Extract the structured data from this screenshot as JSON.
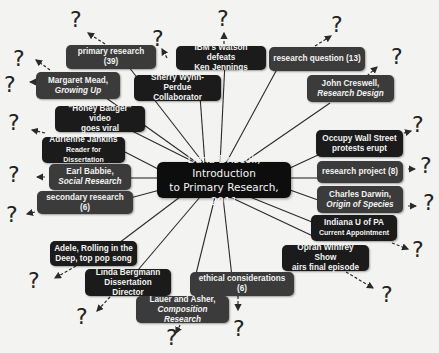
{
  "center": {
    "line1": "Dana Driscoll, Introduction",
    "line2": "to Primary Research, 2011"
  },
  "colors": {
    "background": "#f3f3f1",
    "center_node": "#0d0d0d",
    "dark_node": "#1b1b1b",
    "gray_node": "#3b3b3b",
    "text": "#f2f2f2",
    "link": "#2a2a2a"
  },
  "question_mark": "?",
  "nodes": [
    {
      "id": "primary-research",
      "line1": "primary research (39)",
      "line2": ""
    },
    {
      "id": "ibm-watson",
      "line1": "IBM's Watson defeats",
      "line2": "Ken Jennings"
    },
    {
      "id": "research-question",
      "line1": "research question (13)",
      "line2": ""
    },
    {
      "id": "margaret-mead",
      "line1": "Margaret Mead,",
      "line2": "Growing Up"
    },
    {
      "id": "sherry-wynn-perdue",
      "line1": "Sherry Wynn-Perdue",
      "line2": "Collaborator"
    },
    {
      "id": "john-creswell",
      "line1": "John Creswell,",
      "line2": "Research Design"
    },
    {
      "id": "honey-badger",
      "line1": "\"Honey Badger\" video",
      "line2": "goes viral"
    },
    {
      "id": "adrienne-jankins",
      "line1": "Adrienne Jankins",
      "line2": "Reader for Dissertation"
    },
    {
      "id": "occupy-wall-street",
      "line1": "Occupy Wall Street",
      "line2": "protests erupt"
    },
    {
      "id": "earl-babbie",
      "line1": "Earl Babbie,",
      "line2": "Social Research"
    },
    {
      "id": "research-project",
      "line1": "research project (8)",
      "line2": ""
    },
    {
      "id": "secondary-research",
      "line1": "secondary research (6)",
      "line2": ""
    },
    {
      "id": "charles-darwin",
      "line1": "Charles Darwin,",
      "line2": "Origin of Species"
    },
    {
      "id": "indiana-u-pa",
      "line1": "Indiana U of PA",
      "line2": "Current Appointment"
    },
    {
      "id": "oprah",
      "line1": "Oprah Winfrey Show",
      "line2": "airs final episode"
    },
    {
      "id": "adele",
      "line1": "Adele, Rolling in the",
      "line2": "Deep, top pop song"
    },
    {
      "id": "linda-bergmann",
      "line1": "Linda Bergmann",
      "line2": "Dissertation Director"
    },
    {
      "id": "ethical-considerations",
      "line1": "ethical considerations (6)",
      "line2": ""
    },
    {
      "id": "lauer-asher",
      "line1": "Lauer and Asher,",
      "line2": "Composition Research"
    }
  ]
}
